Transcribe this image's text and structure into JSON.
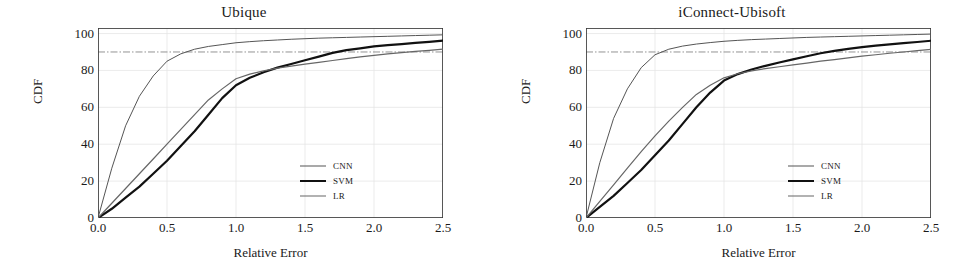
{
  "figure": {
    "panels": [
      {
        "title": "Ubique",
        "xlabel": "Relative Error",
        "ylabel": "CDF"
      },
      {
        "title": "iConnect-Ubisoft",
        "xlabel": "Relative Error",
        "ylabel": "CDF"
      }
    ],
    "xticks": [
      "0.0",
      "0.5",
      "1.0",
      "1.5",
      "2.0",
      "2.5"
    ],
    "yticks": [
      "0",
      "20",
      "40",
      "60",
      "80",
      "100"
    ],
    "legend": [
      {
        "label": "CNN",
        "color": "#555555",
        "width": 1.0
      },
      {
        "label": "SVM",
        "color": "#111111",
        "width": 2.2
      },
      {
        "label": "LR",
        "color": "#666666",
        "width": 1.2
      }
    ]
  },
  "chart_data": [
    {
      "type": "line",
      "title": "Ubique",
      "xlabel": "Relative Error",
      "ylabel": "CDF",
      "xlim": [
        0.0,
        2.5
      ],
      "ylim": [
        0,
        103
      ],
      "grid": true,
      "legend_position": "lower-right",
      "annotations": [
        {
          "type": "hline",
          "y": 90,
          "style": "dash-dot",
          "color": "#777777"
        }
      ],
      "x": [
        0.0,
        0.1,
        0.2,
        0.3,
        0.4,
        0.5,
        0.6,
        0.7,
        0.8,
        0.9,
        1.0,
        1.1,
        1.2,
        1.3,
        1.4,
        1.5,
        1.6,
        1.7,
        1.8,
        1.9,
        2.0,
        2.1,
        2.2,
        2.3,
        2.4,
        2.5
      ],
      "series": [
        {
          "name": "CNN",
          "values": [
            0,
            27,
            50,
            66,
            77,
            85,
            89,
            91.5,
            93,
            94,
            95,
            95.6,
            96.1,
            96.5,
            96.9,
            97.2,
            97.5,
            97.7,
            97.9,
            98.1,
            98.3,
            98.5,
            98.7,
            98.9,
            99.1,
            99.3
          ]
        },
        {
          "name": "SVM",
          "values": [
            0,
            5,
            11,
            17,
            24,
            31,
            39,
            47,
            56,
            65,
            72,
            76,
            79,
            81.5,
            83.5,
            85.5,
            87.5,
            89.5,
            91,
            92,
            93,
            93.7,
            94.3,
            94.9,
            95.5,
            96.2
          ]
        },
        {
          "name": "LR",
          "values": [
            0,
            8,
            16,
            24,
            32,
            40,
            48,
            56,
            64,
            70,
            75.5,
            78,
            79.8,
            81.2,
            82.3,
            83.4,
            84.4,
            85.4,
            86.4,
            87.3,
            88.2,
            89,
            89.7,
            90.3,
            90.9,
            91.6
          ]
        }
      ]
    },
    {
      "type": "line",
      "title": "iConnect-Ubisoft",
      "xlabel": "Relative Error",
      "ylabel": "CDF",
      "xlim": [
        0.0,
        2.5
      ],
      "ylim": [
        0,
        103
      ],
      "grid": true,
      "legend_position": "lower-right",
      "annotations": [
        {
          "type": "hline",
          "y": 90,
          "style": "dash-dot",
          "color": "#777777"
        }
      ],
      "x": [
        0.0,
        0.1,
        0.2,
        0.3,
        0.4,
        0.5,
        0.6,
        0.7,
        0.8,
        0.9,
        1.0,
        1.1,
        1.2,
        1.3,
        1.4,
        1.5,
        1.6,
        1.7,
        1.8,
        1.9,
        2.0,
        2.1,
        2.2,
        2.3,
        2.4,
        2.5
      ],
      "series": [
        {
          "name": "CNN",
          "values": [
            0,
            30,
            54,
            70,
            81.5,
            88.5,
            91.5,
            93.2,
            94.3,
            95.1,
            95.8,
            96.3,
            96.7,
            97.0,
            97.3,
            97.6,
            97.9,
            98.1,
            98.3,
            98.5,
            98.7,
            98.9,
            99.1,
            99.3,
            99.5,
            99.7
          ]
        },
        {
          "name": "SVM",
          "values": [
            0,
            6,
            12,
            19,
            26,
            34,
            42,
            51,
            60,
            68,
            74.5,
            78,
            80.5,
            82.5,
            84.3,
            86,
            87.7,
            89.3,
            90.6,
            91.7,
            92.6,
            93.4,
            94.1,
            94.8,
            95.4,
            96.1
          ]
        },
        {
          "name": "LR",
          "values": [
            0,
            9,
            18,
            27,
            36,
            44.5,
            52.5,
            60,
            67,
            72,
            76,
            78.2,
            79.8,
            81,
            82,
            83,
            84,
            85,
            85.9,
            86.8,
            87.7,
            88.5,
            89.3,
            90,
            90.7,
            91.4
          ]
        }
      ]
    }
  ]
}
